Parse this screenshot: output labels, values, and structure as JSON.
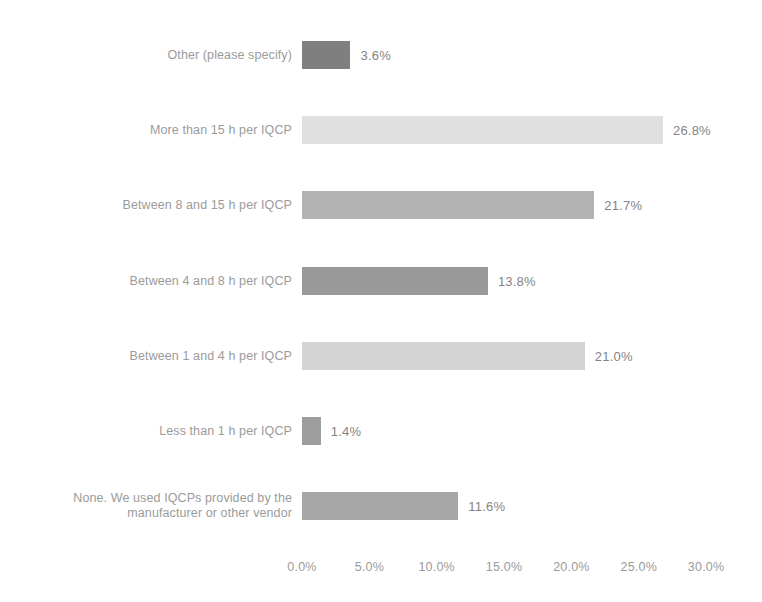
{
  "chart_data": {
    "type": "bar",
    "orientation": "horizontal",
    "title": "",
    "xlabel": "",
    "ylabel": "",
    "xlim": [
      0,
      30
    ],
    "grid": false,
    "legend": false,
    "categories": [
      "Other (please specify)",
      "More than 15 h per IQCP",
      "Between 8 and 15 h per IQCP",
      "Between 4 and 8 h per IQCP",
      "Between 1 and 4 h per IQCP",
      "Less than 1 h per IQCP",
      "None. We used IQCPs provided by the\nmanufacturer or other vendor"
    ],
    "values": [
      3.6,
      26.8,
      21.7,
      13.8,
      21.0,
      1.4,
      11.6
    ],
    "value_labels": [
      "3.6%",
      "26.8%",
      "21.7%",
      "13.8%",
      "21.0%",
      "1.4%",
      "11.6%"
    ],
    "bar_colors": [
      "#6e6e6e",
      "#dcdcdc",
      "#a9a9a9",
      "#8b8b8b",
      "#cfcfcf",
      "#909090",
      "#9a9a9a"
    ],
    "xticks": [
      0,
      5,
      10,
      15,
      20,
      25,
      30
    ],
    "xtick_labels": [
      "0.0%",
      "5.0%",
      "10.0%",
      "15.0%",
      "20.0%",
      "25.0%",
      "30.0%"
    ]
  },
  "style": {
    "background": "#ffffff",
    "label_color": "#8e8e8e",
    "value_color": "#737373",
    "tick_color": "#8e8e8e"
  }
}
